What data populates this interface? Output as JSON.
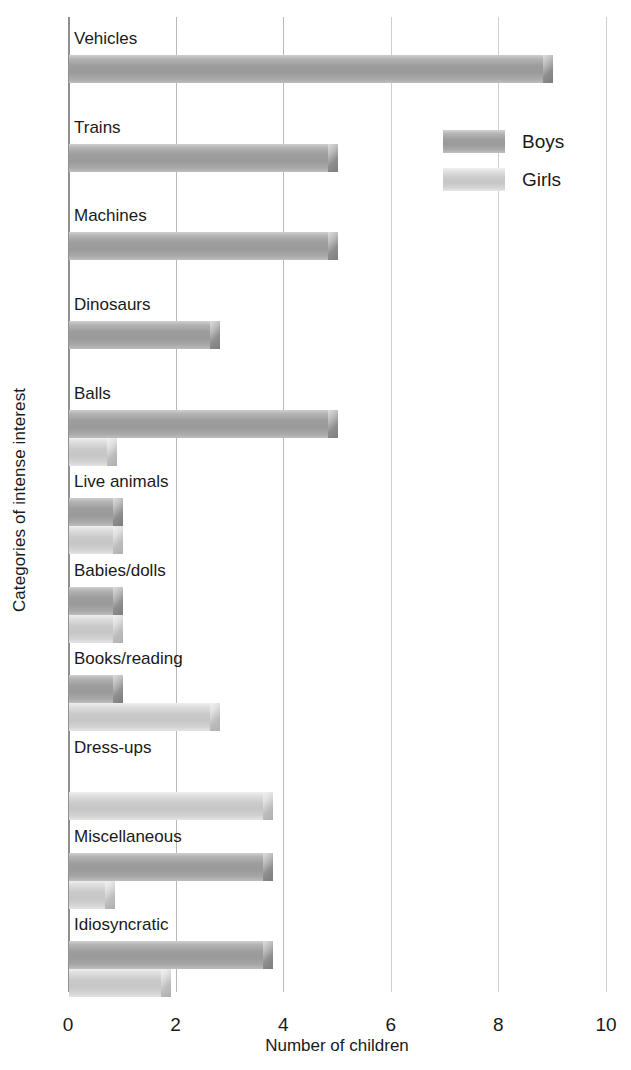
{
  "chart_data": {
    "type": "bar",
    "orientation": "horizontal",
    "title": "",
    "xlabel": "Number of children",
    "ylabel": "Categories of intense interest",
    "xlim": [
      0,
      10
    ],
    "xticks": [
      0,
      2,
      4,
      6,
      8,
      10
    ],
    "xtick_labels": [
      "0",
      "2",
      "4",
      "6",
      "8",
      "10"
    ],
    "grid": true,
    "legend_position": "upper right",
    "categories": [
      "Vehicles",
      "Trains",
      "Machines",
      "Dinosaurs",
      "Balls",
      "Live animals",
      "Babies/dolls",
      "Books/reading",
      "Dress-ups",
      "Miscellaneous",
      "Idiosyncratic"
    ],
    "series": [
      {
        "name": "Boys",
        "color": "#9a9a9a",
        "values": [
          9,
          5,
          5,
          2.8,
          5,
          1,
          1,
          1,
          0,
          3.8,
          3.8
        ]
      },
      {
        "name": "Girls",
        "color": "#c8c8c8",
        "values": [
          0,
          0,
          0,
          0,
          0.9,
          1,
          1,
          2.8,
          3.8,
          0.85,
          1.9
        ]
      }
    ]
  },
  "legend": {
    "items": [
      {
        "label": "Boys",
        "key": "boys"
      },
      {
        "label": "Girls",
        "key": "girls"
      }
    ]
  },
  "axes": {
    "x_title": "Number of children",
    "y_title": "Categories of intense interest"
  }
}
